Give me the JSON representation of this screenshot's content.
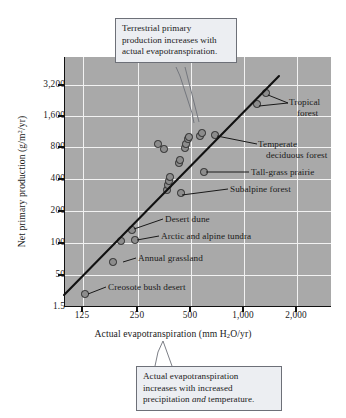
{
  "chart_data": {
    "type": "scatter",
    "title": "",
    "xlabel": "Actual evapotranspiration (mm H2O/yr)",
    "ylabel": "Net primary production (g/m2/yr)",
    "xscale": "log",
    "yscale": "log",
    "grid": true,
    "legend": "none",
    "xticks": [
      {
        "label": "125",
        "value": 125,
        "px": 82
      },
      {
        "label": "250",
        "value": 250,
        "px": 137
      },
      {
        "label": "500",
        "value": 500,
        "px": 190
      },
      {
        "label": "1,000",
        "value": 1000,
        "px": 243
      },
      {
        "label": "2,000",
        "value": 2000,
        "px": 296
      }
    ],
    "yticks": [
      {
        "label": "3,200",
        "value": 3200,
        "px": 85
      },
      {
        "label": "1,600",
        "value": 1600,
        "px": 116
      },
      {
        "label": "800",
        "value": 800,
        "px": 147
      },
      {
        "label": "400",
        "value": 400,
        "px": 179
      },
      {
        "label": "200",
        "value": 200,
        "px": 211
      },
      {
        "label": "100",
        "value": 100,
        "px": 243
      },
      {
        "label": "50",
        "value": 50,
        "px": 275
      },
      {
        "label": "1.5",
        "value": 1.5,
        "px": 307
      }
    ],
    "points": [
      {
        "label": "Creosote bush desert",
        "x": 128,
        "y": 25,
        "px": 84,
        "py": 294
      },
      {
        "label": "",
        "x": 190,
        "y": 72,
        "px": 112,
        "py": 262
      },
      {
        "label": "Annual grassland",
        "x": 205,
        "y": 115,
        "px": 120,
        "py": 241
      },
      {
        "label": "Arctic and alpine tundra",
        "x": 243,
        "y": 117,
        "px": 134,
        "py": 240
      },
      {
        "label": "Desert dune",
        "x": 235,
        "y": 150,
        "px": 131,
        "py": 230
      },
      {
        "label": "",
        "x": 370,
        "y": 330,
        "px": 166,
        "py": 190
      },
      {
        "label": "",
        "x": 375,
        "y": 370,
        "px": 167,
        "py": 185
      },
      {
        "label": "",
        "x": 378,
        "y": 400,
        "px": 168,
        "py": 181
      },
      {
        "label": "",
        "x": 383,
        "y": 430,
        "px": 169,
        "py": 177
      },
      {
        "label": "",
        "x": 412,
        "y": 560,
        "px": 178,
        "py": 163
      },
      {
        "label": "",
        "x": 418,
        "y": 600,
        "px": 179,
        "py": 160
      },
      {
        "label": "",
        "x": 330,
        "y": 880,
        "px": 157,
        "py": 144
      },
      {
        "label": "",
        "x": 352,
        "y": 770,
        "px": 163,
        "py": 149
      },
      {
        "label": "",
        "x": 437,
        "y": 790,
        "px": 184,
        "py": 148
      },
      {
        "label": "",
        "x": 442,
        "y": 860,
        "px": 185,
        "py": 144
      },
      {
        "label": "",
        "x": 449,
        "y": 960,
        "px": 187,
        "py": 139
      },
      {
        "label": "",
        "x": 455,
        "y": 1010,
        "px": 188,
        "py": 137
      },
      {
        "label": "",
        "x": 512,
        "y": 1030,
        "px": 199,
        "py": 136
      },
      {
        "label": "",
        "x": 523,
        "y": 1090,
        "px": 201,
        "py": 133
      },
      {
        "label": "Temperate deciduous forest",
        "x": 598,
        "y": 1040,
        "px": 214,
        "py": 135
      },
      {
        "label": "Tall-grass prairie",
        "x": 530,
        "y": 480,
        "px": 203,
        "py": 172
      },
      {
        "label": "Subalpine forest",
        "x": 420,
        "y": 310,
        "px": 180,
        "py": 193
      },
      {
        "label": "Tropical forest",
        "x": 1160,
        "y": 1950,
        "px": 256,
        "py": 104
      },
      {
        "label": "Tropical forest",
        "x": 1380,
        "y": 2500,
        "px": 265,
        "py": 93
      }
    ],
    "trendline": {
      "x1": 64,
      "y1": 295,
      "x2": 278,
      "y2": 77,
      "description": "linear regression on log-log axes"
    },
    "annotations": [
      {
        "name": "tropical-forest",
        "lines": [
          "Tropical",
          "forest"
        ]
      },
      {
        "name": "temperate-deciduous-forest",
        "lines": [
          "Temperate",
          "deciduous forest"
        ]
      },
      {
        "name": "tall-grass-prairie",
        "lines": [
          "Tall-grass prairie"
        ]
      },
      {
        "name": "subalpine-forest",
        "lines": [
          "Subalpine forest"
        ]
      },
      {
        "name": "desert-dune",
        "lines": [
          "Desert dune"
        ]
      },
      {
        "name": "arctic-and-alpine-tundra",
        "lines": [
          "Arctic and alpine tundra"
        ]
      },
      {
        "name": "annual-grassland",
        "lines": [
          "Annual grassland"
        ]
      },
      {
        "name": "creosote-bush-desert",
        "lines": [
          "Creosote bush desert"
        ]
      }
    ],
    "callouts": [
      {
        "name": "top",
        "lines": [
          "Terrestrial primary",
          "production increases with",
          "actual evapotranspiration."
        ]
      },
      {
        "name": "bottom",
        "lines": [
          "Actual evapotranspiration",
          "increases with increased",
          "precipitation and temperature."
        ]
      }
    ],
    "colors": {
      "plot_background": "#a9a9a9",
      "gridline": "#f2f2f2",
      "marker_fill": "#8c8c8c",
      "marker_stroke": "#2b2b2b",
      "trendline": "#111111",
      "callout_background": "#eceef2",
      "callout_border": "#6d7078"
    }
  },
  "axes": {
    "x_title_pre": "Actual evapotranspiration (mm H",
    "x_title_sub": "2",
    "x_title_post": "O/yr)",
    "y_title_pre": "Net primary production (g/m",
    "y_title_sup": "2",
    "y_title_post": "/yr)"
  },
  "callout_top": {
    "line1": "Terrestrial primary",
    "line2": "production increases with",
    "line3": "actual evapotranspiration."
  },
  "callout_bottom": {
    "line1": "Actual evapotranspiration",
    "line2": "increases with increased",
    "line3_a": "precipitation ",
    "line3_em": "and",
    "line3_b": " temperature."
  },
  "labels": {
    "tropical_1": "Tropical",
    "tropical_2": "forest",
    "temperate_1": "Temperate",
    "temperate_2": "deciduous forest",
    "tallgrass": "Tall-grass prairie",
    "subalpine": "Subalpine forest",
    "desert_dune": "Desert dune",
    "tundra": "Arctic and alpine tundra",
    "annual_grassland": "Annual grassland",
    "creosote": "Creosote bush desert"
  }
}
